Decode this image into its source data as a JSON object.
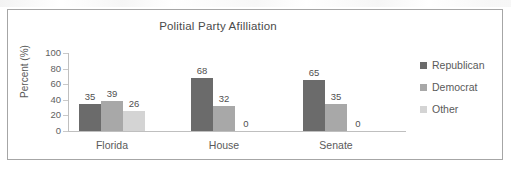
{
  "chart_data": {
    "type": "bar",
    "title": "Politial Party Afilliation",
    "xlabel": "",
    "ylabel": "Percent (%)",
    "ylim": [
      0,
      100
    ],
    "yticks": [
      100,
      80,
      60,
      40,
      20,
      0
    ],
    "categories": [
      "Florida",
      "House",
      "Senate"
    ],
    "series": [
      {
        "name": "Republican",
        "color": "#6b6b6b",
        "values": [
          35,
          68,
          65
        ]
      },
      {
        "name": "Democrat",
        "color": "#a8a8a8",
        "values": [
          39,
          32,
          35
        ]
      },
      {
        "name": "Other",
        "color": "#d4d4d4",
        "values": [
          26,
          0,
          0
        ]
      }
    ],
    "data_labels": [
      [
        "35",
        "39",
        "26"
      ],
      [
        "68",
        "32",
        "0"
      ],
      [
        "65",
        "35",
        "0"
      ]
    ],
    "grid": false,
    "legend_position": "right",
    "frame_border_color": "#a6a6a6",
    "axis_color": "#bfbfbf"
  }
}
